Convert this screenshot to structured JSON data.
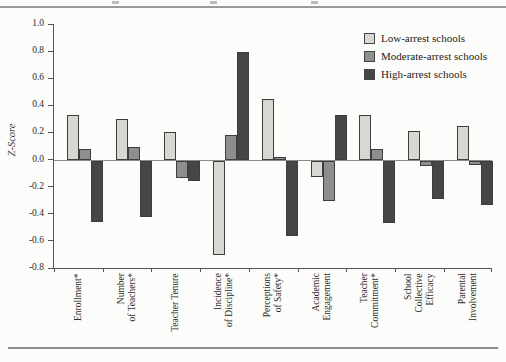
{
  "page": {
    "background_color": "#fcfcfa",
    "top_rule_color": "#9a9a9a",
    "bottom_rule_color": "#8d8d8d"
  },
  "chart_data": {
    "type": "bar",
    "title": "",
    "ylabel": "Z-Score",
    "xlabel": "",
    "ylim": [
      -0.8,
      1.0
    ],
    "ytick_step": 0.2,
    "yticks": [
      "1.0",
      "0.8",
      "0.6",
      "0.4",
      "0.2",
      "0.0",
      "-0.2",
      "-0.4",
      "-0.6",
      "-0.8"
    ],
    "grid": false,
    "legend_position": "top-right",
    "categories": [
      "Enrollment*",
      "Number of Teachers*",
      "Teacher Tenure",
      "Incidence of Discipline*",
      "Perceptions of Safety*",
      "Academic Engagement",
      "Teacher Commitment*",
      "School Collective Efficacy",
      "Parental Involvement"
    ],
    "category_label_lines": [
      [
        "Enrollment*"
      ],
      [
        "Number",
        "of Teachers*"
      ],
      [
        "Teacher Tenure"
      ],
      [
        "Incidence",
        "of Discipline*"
      ],
      [
        "Perceptions",
        "of Safety*"
      ],
      [
        "Academic",
        "Engagement"
      ],
      [
        "Teacher",
        "Commitment*"
      ],
      [
        "School",
        "Collective",
        "Efficacy"
      ],
      [
        "Parental",
        "Involvement"
      ]
    ],
    "series": [
      {
        "name": "Low-arrest schools",
        "color": "#d9d7d2",
        "values": [
          0.33,
          0.3,
          0.2,
          -0.7,
          0.45,
          -0.12,
          0.33,
          0.21,
          0.25
        ]
      },
      {
        "name": "Moderate-arrest schools",
        "color": "#8e8e8e",
        "values": [
          0.08,
          0.09,
          -0.13,
          0.18,
          0.02,
          -0.3,
          0.08,
          -0.04,
          -0.03
        ]
      },
      {
        "name": "High-arrest schools",
        "color": "#474545",
        "values": [
          -0.45,
          -0.42,
          -0.15,
          0.79,
          -0.56,
          0.33,
          -0.46,
          -0.28,
          -0.33
        ]
      }
    ]
  }
}
